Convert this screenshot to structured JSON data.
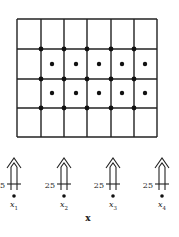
{
  "diagram": {
    "grid": {
      "x_lines": [
        17,
        41,
        64,
        87,
        111,
        134,
        157
      ],
      "y_lines": [
        19,
        49,
        79,
        108,
        137
      ],
      "columns": 6,
      "rows": 4,
      "stroke_color": "#222222"
    },
    "junction_dots": {
      "x": [
        41,
        64,
        87,
        111,
        134
      ],
      "y": [
        49,
        79,
        108
      ]
    },
    "cell_dots": {
      "x": [
        52,
        76,
        99,
        122,
        145
      ],
      "y": [
        64,
        93
      ]
    },
    "sensors": [
      {
        "value_label": "25",
        "point_label": "x",
        "subscript": "1",
        "cx": 14
      },
      {
        "value_label": "25",
        "point_label": "x",
        "subscript": "2",
        "cx": 64
      },
      {
        "value_label": "25",
        "point_label": "x",
        "subscript": "3",
        "cx": 113
      },
      {
        "value_label": "25",
        "point_label": "x",
        "subscript": "4",
        "cx": 162
      }
    ],
    "axis_label": "x"
  }
}
